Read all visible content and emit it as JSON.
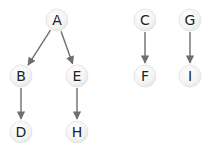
{
  "diagram": {
    "type": "forest",
    "node_radius": 11,
    "colors": {
      "node_fill": "#f4f4f4",
      "node_edge": "#e2e2e2",
      "edge": "#6e6e6e",
      "text": "#222222"
    },
    "nodes": [
      {
        "id": "A",
        "label": "A",
        "x": 57,
        "y": 20
      },
      {
        "id": "B",
        "label": "B",
        "x": 21,
        "y": 76
      },
      {
        "id": "E",
        "label": "E",
        "x": 77,
        "y": 76
      },
      {
        "id": "D",
        "label": "D",
        "x": 21,
        "y": 132
      },
      {
        "id": "H",
        "label": "H",
        "x": 77,
        "y": 132
      },
      {
        "id": "C",
        "label": "C",
        "x": 145,
        "y": 20
      },
      {
        "id": "F",
        "label": "F",
        "x": 145,
        "y": 76
      },
      {
        "id": "G",
        "label": "G",
        "x": 190,
        "y": 20
      },
      {
        "id": "I",
        "label": "I",
        "x": 190,
        "y": 76
      }
    ],
    "edges": [
      {
        "from": "A",
        "to": "B"
      },
      {
        "from": "A",
        "to": "E"
      },
      {
        "from": "B",
        "to": "D"
      },
      {
        "from": "E",
        "to": "H"
      },
      {
        "from": "C",
        "to": "F"
      },
      {
        "from": "G",
        "to": "I"
      }
    ]
  }
}
